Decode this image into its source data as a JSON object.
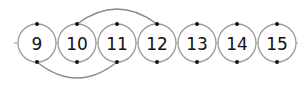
{
  "diagram": {
    "type": "number-line-circles",
    "line": {
      "x1": 14,
      "x2": 298,
      "y": 43,
      "color": "#9a9a9a"
    },
    "circle_radius": 19,
    "circle_color": "#9a9a9a",
    "dot_color": "#111111",
    "nodes": [
      {
        "label": "9",
        "cx": 37
      },
      {
        "label": "10",
        "cx": 77
      },
      {
        "label": "11",
        "cx": 117
      },
      {
        "label": "12",
        "cx": 157
      },
      {
        "label": "13",
        "cx": 197
      },
      {
        "label": "14",
        "cx": 237
      },
      {
        "label": "15",
        "cx": 277
      }
    ],
    "arcs": [
      {
        "from": "10",
        "to": "12",
        "side": "top"
      },
      {
        "from": "9",
        "to": "11",
        "side": "bottom"
      }
    ]
  }
}
